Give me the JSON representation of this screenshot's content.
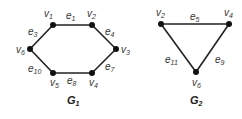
{
  "graphs": [
    {
      "title": "G",
      "title_sub": "1",
      "vertices": [
        {
          "id": "v1",
          "name": "v",
          "sub": "1",
          "x": 53,
          "y": 25,
          "lx": 44,
          "ly": 17
        },
        {
          "id": "v2",
          "name": "v",
          "sub": "2",
          "x": 92,
          "y": 25,
          "lx": 87,
          "ly": 17
        },
        {
          "id": "v3",
          "name": "v",
          "sub": "3",
          "x": 116,
          "y": 49,
          "lx": 121,
          "ly": 53
        },
        {
          "id": "v4",
          "name": "v",
          "sub": "4",
          "x": 92,
          "y": 73,
          "lx": 89,
          "ly": 86
        },
        {
          "id": "v5",
          "name": "v",
          "sub": "5",
          "x": 53,
          "y": 73,
          "lx": 50,
          "ly": 86
        },
        {
          "id": "v6",
          "name": "v",
          "sub": "6",
          "x": 30,
          "y": 49,
          "lx": 16,
          "ly": 53
        }
      ],
      "edges": [
        {
          "id": "e1",
          "name": "e",
          "sub": "1",
          "from": "v1",
          "to": "v2",
          "lx": 66,
          "ly": 19
        },
        {
          "id": "e4",
          "name": "e",
          "sub": "4",
          "from": "v2",
          "to": "v3",
          "lx": 105,
          "ly": 35
        },
        {
          "id": "e7",
          "name": "e",
          "sub": "7",
          "from": "v3",
          "to": "v4",
          "lx": 105,
          "ly": 70
        },
        {
          "id": "e8",
          "name": "e",
          "sub": "8",
          "from": "v4",
          "to": "v5",
          "lx": 67,
          "ly": 84
        },
        {
          "id": "e10",
          "name": "e",
          "sub": "10",
          "from": "v5",
          "to": "v6",
          "lx": 28,
          "ly": 72
        },
        {
          "id": "e3",
          "name": "e",
          "sub": "3",
          "from": "v6",
          "to": "v1",
          "lx": 28,
          "ly": 35
        }
      ]
    },
    {
      "title": "G",
      "title_sub": "2",
      "vertices": [
        {
          "id": "v2",
          "name": "v",
          "sub": "2",
          "x": 161,
          "y": 24,
          "lx": 156,
          "ly": 16
        },
        {
          "id": "v4",
          "name": "v",
          "sub": "4",
          "x": 229,
          "y": 24,
          "lx": 224,
          "ly": 16
        },
        {
          "id": "v6",
          "name": "v",
          "sub": "6",
          "x": 196,
          "y": 72,
          "lx": 192,
          "ly": 86
        }
      ],
      "edges": [
        {
          "id": "e5",
          "name": "e",
          "sub": "5",
          "from": "v2",
          "to": "v4",
          "lx": 190,
          "ly": 20
        },
        {
          "id": "e11",
          "name": "e",
          "sub": "11",
          "from": "v2",
          "to": "v6",
          "lx": 165,
          "ly": 63
        },
        {
          "id": "e9",
          "name": "e",
          "sub": "9",
          "from": "v4",
          "to": "v6",
          "lx": 215,
          "ly": 63
        }
      ]
    }
  ],
  "extra_label": {
    "name": "v",
    "sub": "3"
  },
  "colors": {
    "edge": "#222222",
    "node": "#111111",
    "text": "#333333"
  }
}
